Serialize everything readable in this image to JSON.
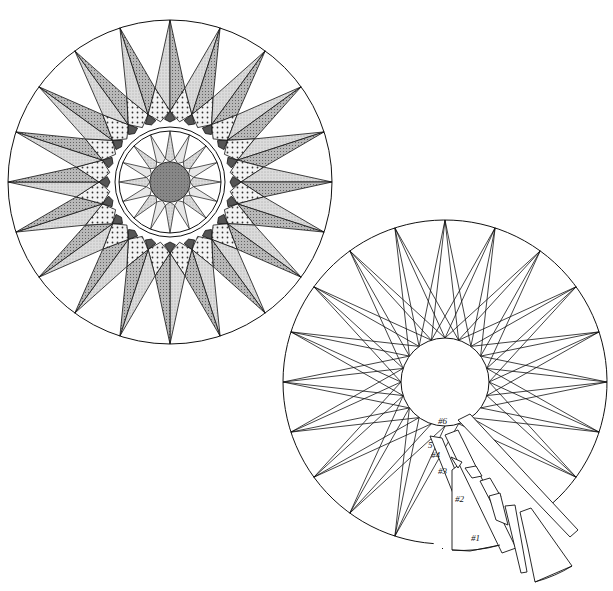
{
  "diagram": {
    "type": "quilt-block-pattern",
    "colors": {
      "line": "#111111",
      "background": "#ffffff",
      "dark_fill": "#555555",
      "medium_fill": "#9a9a9a",
      "light_fill": "#d6d6d6"
    },
    "finished_block": {
      "center": [
        170,
        182
      ],
      "outer_radius": 162,
      "star_points": 20,
      "inner_ring_radius": 55,
      "inner_ring_width": 4,
      "inner_star_points": 16,
      "center_circle_radius": 20
    },
    "piecing_diagram": {
      "center": [
        445,
        382
      ],
      "outer_radius": 162,
      "star_points": 20,
      "center_circle_radius": 44,
      "piece_labels": [
        {
          "text": "#6",
          "x": 438,
          "y": 424
        },
        {
          "text": "5",
          "x": 428,
          "y": 448
        },
        {
          "text": "#4",
          "x": 431,
          "y": 458
        },
        {
          "text": "#3",
          "x": 438,
          "y": 474
        },
        {
          "text": "#2",
          "x": 455,
          "y": 502
        },
        {
          "text": "#1",
          "x": 471,
          "y": 541
        }
      ]
    }
  }
}
